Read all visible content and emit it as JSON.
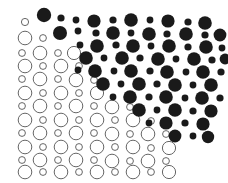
{
  "figure": {
    "width": 228,
    "height": 183,
    "background_color": "#ffffff"
  },
  "style": {
    "fill_color": "#1a1a1a",
    "outline_stroke_color": "#555555",
    "outline_fill_color": "#ffffff",
    "outline_stroke_width": 0.9
  },
  "grid": {
    "origin_x": 20,
    "origin_y": 12,
    "column_spacing": 10.6,
    "row_spacing": 8.6,
    "large_radius": 6.6,
    "small_radius": 3.4,
    "note": "Alternating large and small circles on a staggered lattice; parity of (row+col) selects size."
  },
  "chart_data": {
    "type": "scatter",
    "xlabel": "",
    "ylabel": "",
    "xlim": [
      0,
      228
    ],
    "ylim": [
      0,
      183
    ],
    "grid": false,
    "legend": null,
    "series": [
      {
        "name": "filled-circles",
        "style": "filled",
        "color": "#1a1a1a",
        "points": [
          {
            "x": 44,
            "y": 15,
            "r": 7.2
          },
          {
            "x": 61,
            "y": 18,
            "r": 3.6
          },
          {
            "x": 76,
            "y": 20,
            "r": 3.4
          },
          {
            "x": 94,
            "y": 21,
            "r": 6.6
          },
          {
            "x": 113,
            "y": 20,
            "r": 3.6
          },
          {
            "x": 131,
            "y": 20,
            "r": 6.8
          },
          {
            "x": 150,
            "y": 20,
            "r": 3.4
          },
          {
            "x": 168,
            "y": 21,
            "r": 6.6
          },
          {
            "x": 188,
            "y": 22,
            "r": 3.6
          },
          {
            "x": 205,
            "y": 23,
            "r": 6.8
          },
          {
            "x": 60,
            "y": 33,
            "r": 7.0
          },
          {
            "x": 78,
            "y": 31,
            "r": 3.4
          },
          {
            "x": 96,
            "y": 33,
            "r": 3.6
          },
          {
            "x": 113,
            "y": 33,
            "r": 6.8
          },
          {
            "x": 131,
            "y": 33,
            "r": 3.4
          },
          {
            "x": 149,
            "y": 34,
            "r": 6.8
          },
          {
            "x": 167,
            "y": 34,
            "r": 3.6
          },
          {
            "x": 186,
            "y": 34,
            "r": 6.8
          },
          {
            "x": 205,
            "y": 35,
            "r": 3.6
          },
          {
            "x": 220,
            "y": 35,
            "r": 6.4
          },
          {
            "x": 80,
            "y": 45,
            "r": 3.4
          },
          {
            "x": 97,
            "y": 46,
            "r": 6.8
          },
          {
            "x": 116,
            "y": 45,
            "r": 3.6
          },
          {
            "x": 133,
            "y": 46,
            "r": 6.8
          },
          {
            "x": 151,
            "y": 46,
            "r": 3.4
          },
          {
            "x": 169,
            "y": 46,
            "r": 6.8
          },
          {
            "x": 188,
            "y": 47,
            "r": 3.6
          },
          {
            "x": 206,
            "y": 47,
            "r": 6.8
          },
          {
            "x": 222,
            "y": 48,
            "r": 3.4
          },
          {
            "x": 86,
            "y": 58,
            "r": 6.8
          },
          {
            "x": 104,
            "y": 58,
            "r": 3.4
          },
          {
            "x": 122,
            "y": 58,
            "r": 6.8
          },
          {
            "x": 140,
            "y": 58,
            "r": 3.6
          },
          {
            "x": 158,
            "y": 59,
            "r": 6.8
          },
          {
            "x": 176,
            "y": 59,
            "r": 3.4
          },
          {
            "x": 194,
            "y": 59,
            "r": 6.8
          },
          {
            "x": 212,
            "y": 60,
            "r": 3.6
          },
          {
            "x": 225,
            "y": 59,
            "r": 5.4
          },
          {
            "x": 78,
            "y": 70,
            "r": 3.4
          },
          {
            "x": 95,
            "y": 71,
            "r": 6.8
          },
          {
            "x": 114,
            "y": 71,
            "r": 3.4
          },
          {
            "x": 131,
            "y": 71,
            "r": 6.8
          },
          {
            "x": 150,
            "y": 71,
            "r": 3.6
          },
          {
            "x": 167,
            "y": 72,
            "r": 6.8
          },
          {
            "x": 186,
            "y": 72,
            "r": 3.4
          },
          {
            "x": 203,
            "y": 72,
            "r": 6.8
          },
          {
            "x": 221,
            "y": 72,
            "r": 3.6
          },
          {
            "x": 103,
            "y": 84,
            "r": 6.8
          },
          {
            "x": 121,
            "y": 84,
            "r": 3.4
          },
          {
            "x": 139,
            "y": 84,
            "r": 6.8
          },
          {
            "x": 157,
            "y": 84,
            "r": 3.6
          },
          {
            "x": 175,
            "y": 85,
            "r": 6.8
          },
          {
            "x": 193,
            "y": 85,
            "r": 3.4
          },
          {
            "x": 211,
            "y": 85,
            "r": 6.8
          },
          {
            "x": 113,
            "y": 97,
            "r": 3.4
          },
          {
            "x": 130,
            "y": 97,
            "r": 6.8
          },
          {
            "x": 149,
            "y": 97,
            "r": 3.6
          },
          {
            "x": 166,
            "y": 97,
            "r": 6.8
          },
          {
            "x": 185,
            "y": 98,
            "r": 3.4
          },
          {
            "x": 202,
            "y": 98,
            "r": 6.8
          },
          {
            "x": 220,
            "y": 98,
            "r": 3.6
          },
          {
            "x": 139,
            "y": 110,
            "r": 6.8
          },
          {
            "x": 157,
            "y": 110,
            "r": 3.4
          },
          {
            "x": 175,
            "y": 110,
            "r": 6.8
          },
          {
            "x": 193,
            "y": 111,
            "r": 3.6
          },
          {
            "x": 211,
            "y": 111,
            "r": 6.6
          },
          {
            "x": 149,
            "y": 123,
            "r": 3.4
          },
          {
            "x": 166,
            "y": 123,
            "r": 6.6
          },
          {
            "x": 185,
            "y": 123,
            "r": 3.6
          },
          {
            "x": 203,
            "y": 124,
            "r": 6.6
          },
          {
            "x": 175,
            "y": 136,
            "r": 6.4
          },
          {
            "x": 193,
            "y": 136,
            "r": 3.4
          },
          {
            "x": 208,
            "y": 137,
            "r": 6.2
          }
        ]
      },
      {
        "name": "outline-circles",
        "style": "outline",
        "color": "#555555",
        "points": [
          {
            "x": 25,
            "y": 22,
            "r": 3.6
          },
          {
            "x": 25,
            "y": 38,
            "r": 6.8
          },
          {
            "x": 43,
            "y": 38,
            "r": 3.4
          },
          {
            "x": 22,
            "y": 53,
            "r": 3.4
          },
          {
            "x": 40,
            "y": 53,
            "r": 6.8
          },
          {
            "x": 58,
            "y": 53,
            "r": 3.4
          },
          {
            "x": 74,
            "y": 53,
            "r": 6.6
          },
          {
            "x": 25,
            "y": 66,
            "r": 6.8
          },
          {
            "x": 43,
            "y": 66,
            "r": 3.4
          },
          {
            "x": 61,
            "y": 66,
            "r": 6.8
          },
          {
            "x": 79,
            "y": 66,
            "r": 3.4
          },
          {
            "x": 22,
            "y": 79,
            "r": 3.4
          },
          {
            "x": 40,
            "y": 79,
            "r": 6.8
          },
          {
            "x": 58,
            "y": 79,
            "r": 3.4
          },
          {
            "x": 76,
            "y": 80,
            "r": 6.8
          },
          {
            "x": 94,
            "y": 80,
            "r": 3.4
          },
          {
            "x": 25,
            "y": 93,
            "r": 6.8
          },
          {
            "x": 43,
            "y": 93,
            "r": 3.4
          },
          {
            "x": 61,
            "y": 93,
            "r": 6.8
          },
          {
            "x": 79,
            "y": 93,
            "r": 3.4
          },
          {
            "x": 97,
            "y": 93,
            "r": 6.6
          },
          {
            "x": 22,
            "y": 106,
            "r": 3.4
          },
          {
            "x": 40,
            "y": 106,
            "r": 6.8
          },
          {
            "x": 58,
            "y": 106,
            "r": 3.4
          },
          {
            "x": 76,
            "y": 106,
            "r": 6.8
          },
          {
            "x": 94,
            "y": 106,
            "r": 3.4
          },
          {
            "x": 112,
            "y": 107,
            "r": 6.8
          },
          {
            "x": 130,
            "y": 107,
            "r": 3.4
          },
          {
            "x": 25,
            "y": 120,
            "r": 6.8
          },
          {
            "x": 43,
            "y": 120,
            "r": 3.4
          },
          {
            "x": 61,
            "y": 120,
            "r": 6.8
          },
          {
            "x": 79,
            "y": 120,
            "r": 3.4
          },
          {
            "x": 97,
            "y": 120,
            "r": 6.8
          },
          {
            "x": 115,
            "y": 120,
            "r": 3.4
          },
          {
            "x": 133,
            "y": 120,
            "r": 6.8
          },
          {
            "x": 151,
            "y": 121,
            "r": 3.4
          },
          {
            "x": 22,
            "y": 133,
            "r": 3.4
          },
          {
            "x": 40,
            "y": 133,
            "r": 6.8
          },
          {
            "x": 58,
            "y": 133,
            "r": 3.4
          },
          {
            "x": 76,
            "y": 133,
            "r": 6.8
          },
          {
            "x": 94,
            "y": 133,
            "r": 3.4
          },
          {
            "x": 112,
            "y": 134,
            "r": 6.8
          },
          {
            "x": 130,
            "y": 134,
            "r": 3.4
          },
          {
            "x": 148,
            "y": 134,
            "r": 6.8
          },
          {
            "x": 166,
            "y": 134,
            "r": 3.4
          },
          {
            "x": 25,
            "y": 147,
            "r": 6.8
          },
          {
            "x": 43,
            "y": 147,
            "r": 3.4
          },
          {
            "x": 61,
            "y": 147,
            "r": 6.8
          },
          {
            "x": 79,
            "y": 147,
            "r": 3.4
          },
          {
            "x": 97,
            "y": 147,
            "r": 6.8
          },
          {
            "x": 115,
            "y": 147,
            "r": 3.4
          },
          {
            "x": 133,
            "y": 147,
            "r": 6.8
          },
          {
            "x": 151,
            "y": 148,
            "r": 3.4
          },
          {
            "x": 169,
            "y": 148,
            "r": 6.6
          },
          {
            "x": 22,
            "y": 160,
            "r": 3.4
          },
          {
            "x": 40,
            "y": 160,
            "r": 6.8
          },
          {
            "x": 58,
            "y": 160,
            "r": 3.4
          },
          {
            "x": 76,
            "y": 160,
            "r": 6.8
          },
          {
            "x": 94,
            "y": 160,
            "r": 3.4
          },
          {
            "x": 112,
            "y": 161,
            "r": 6.8
          },
          {
            "x": 130,
            "y": 161,
            "r": 3.4
          },
          {
            "x": 148,
            "y": 161,
            "r": 6.8
          },
          {
            "x": 166,
            "y": 161,
            "r": 3.4
          },
          {
            "x": 25,
            "y": 172,
            "r": 6.8
          },
          {
            "x": 43,
            "y": 172,
            "r": 3.4
          },
          {
            "x": 61,
            "y": 172,
            "r": 6.8
          },
          {
            "x": 79,
            "y": 172,
            "r": 3.4
          },
          {
            "x": 97,
            "y": 172,
            "r": 6.8
          },
          {
            "x": 115,
            "y": 172,
            "r": 3.4
          },
          {
            "x": 133,
            "y": 172,
            "r": 6.8
          },
          {
            "x": 151,
            "y": 172,
            "r": 3.4
          },
          {
            "x": 169,
            "y": 172,
            "r": 6.6
          }
        ]
      }
    ]
  }
}
